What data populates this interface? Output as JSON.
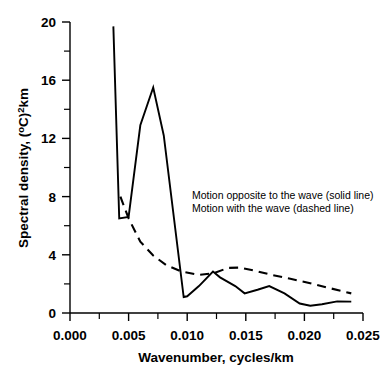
{
  "chart_data": {
    "type": "line",
    "title": "",
    "xlabel": "Wavenumber,  cycles/km",
    "ylabel_parts": {
      "main": "Spectral density, (",
      "degree": "o",
      "c": "C)",
      "exp": "2",
      "unit": "km"
    },
    "ylabel": "Spectral density, (oC)2km",
    "xlim": [
      0.0,
      0.025
    ],
    "ylim": [
      0,
      20
    ],
    "xticks": [
      0.0,
      0.005,
      0.01,
      0.015,
      0.02,
      0.025
    ],
    "xtick_labels": [
      "0.000",
      "0.005",
      "0.010",
      "0.015",
      "0.020",
      "0.025"
    ],
    "yticks": [
      0,
      4,
      8,
      12,
      16,
      20
    ],
    "ytick_labels": [
      "0",
      "4",
      "8",
      "12",
      "16",
      "20"
    ],
    "yticks_minor": [
      2,
      6,
      10,
      14,
      18
    ],
    "xticks_minor": [
      0.0025,
      0.0075,
      0.0125,
      0.0175,
      0.0225
    ],
    "grid": false,
    "legend_position": "inside-upper-right",
    "series": [
      {
        "name": "Motion opposite to the wave (solid line)",
        "style": "solid",
        "x": [
          0.0037,
          0.0042,
          0.005,
          0.006,
          0.0071,
          0.008,
          0.0097,
          0.01,
          0.011,
          0.0122,
          0.0128,
          0.0141,
          0.0149,
          0.016,
          0.017,
          0.0183,
          0.0196,
          0.0205,
          0.0215,
          0.0228,
          0.024
        ],
        "y": [
          19.7,
          6.5,
          6.6,
          12.9,
          15.5,
          12.2,
          1.1,
          1.15,
          1.85,
          2.85,
          2.45,
          1.85,
          1.35,
          1.6,
          1.85,
          1.35,
          0.65,
          0.5,
          0.6,
          0.8,
          0.78
        ]
      },
      {
        "name": "Motion with the wave (dashed line)",
        "style": "dashed",
        "x": [
          0.0043,
          0.005,
          0.006,
          0.0071,
          0.0082,
          0.0095,
          0.011,
          0.0122,
          0.0135,
          0.0145,
          0.0158,
          0.0172,
          0.0188,
          0.0205,
          0.0222,
          0.024
        ],
        "y": [
          8.0,
          6.5,
          4.9,
          3.95,
          3.3,
          2.85,
          2.62,
          2.72,
          3.1,
          3.12,
          2.9,
          2.62,
          2.35,
          2.05,
          1.7,
          1.35
        ]
      }
    ],
    "annotations": [
      "Motion opposite to the wave (solid line)",
      "Motion with the wave (dashed line)"
    ]
  },
  "legend": {
    "line1": "Motion opposite to the wave (solid line)",
    "line2": "Motion with the wave (dashed line)"
  },
  "axes": {
    "x_title": "Wavenumber,  cycles/km",
    "y_title_main": "Spectral density, (",
    "y_title_degree": "o",
    "y_title_c": "C)",
    "y_title_exp": "2",
    "y_title_unit": "km",
    "xtick_0": "0.000",
    "xtick_1": "0.005",
    "xtick_2": "0.010",
    "xtick_3": "0.015",
    "xtick_4": "0.020",
    "xtick_5": "0.025",
    "ytick_0": "0",
    "ytick_1": "4",
    "ytick_2": "8",
    "ytick_3": "12",
    "ytick_4": "16",
    "ytick_5": "20"
  }
}
